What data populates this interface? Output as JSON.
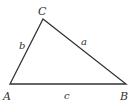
{
  "diagram": {
    "type": "triangle",
    "vertices": [
      {
        "name": "A",
        "x": 10,
        "y": 84,
        "label_x": 3,
        "label_y": 100
      },
      {
        "name": "B",
        "x": 126,
        "y": 84,
        "label_x": 120,
        "label_y": 100
      },
      {
        "name": "C",
        "x": 43,
        "y": 19,
        "label_x": 38,
        "label_y": 15
      }
    ],
    "sides": [
      {
        "name": "a",
        "from": "B",
        "to": "C",
        "label_x": 81,
        "label_y": 45
      },
      {
        "name": "b",
        "from": "C",
        "to": "A",
        "label_x": 19,
        "label_y": 49
      },
      {
        "name": "c",
        "from": "A",
        "to": "B",
        "label_x": 64,
        "label_y": 99
      }
    ],
    "stroke_color": "#333333"
  }
}
